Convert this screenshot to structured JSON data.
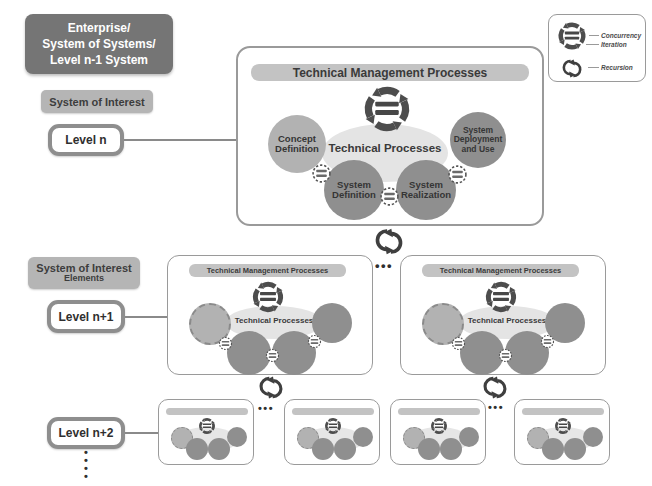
{
  "left_column": {
    "enterprise": "Enterprise/\nSystem of Systems/\nLevel n-1 System",
    "system_of_interest": "System of Interest",
    "soi_elements": "System of Interest",
    "soi_elements_sub": "Elements",
    "level_n": "Level n",
    "level_n1": "Level n+1",
    "level_n2": "Level n+2"
  },
  "legend": {
    "concurrency": "Concurrency",
    "iteration": "Iteration",
    "recursion": "Recursion"
  },
  "level_n_box": {
    "tmp": "Technical Management Processes",
    "tp": "Technical Processes",
    "concept": "Concept\nDefinition",
    "definition": "System\nDefinition",
    "realization": "System\nRealization",
    "deployment": "System\nDeployment\nand Use"
  },
  "level_n1_box": {
    "tmp": "Technical Management Processes",
    "tp": "Technical Processes"
  },
  "dots": {
    "h": "•••",
    "v": "•\n•\n•\n•"
  },
  "colors": {
    "enterprise_fill": "#757575",
    "label_fill": "#b5b5b5",
    "bar_fill": "#c3c3c3",
    "circle_dark": "#8f8f8f",
    "circle_light": "#b2b2b2",
    "ellipse_fill": "#e4e4e4",
    "icon_gray": "#4d4d4d",
    "text_dark": "#3a3a3a"
  }
}
